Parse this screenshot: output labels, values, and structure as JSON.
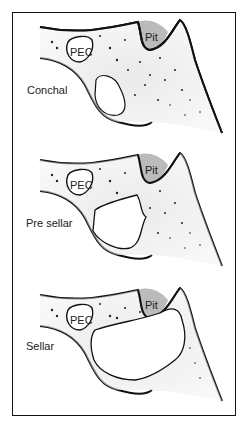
{
  "panels": [
    {
      "name": "conchal",
      "label": "Conchal",
      "pec": "PEC",
      "pit": "Pit"
    },
    {
      "name": "pre-sellar",
      "label": "Pre sellar",
      "pec": "PEC",
      "pit": "Pit"
    },
    {
      "name": "sellar",
      "label": "Sellar",
      "pec": "PEC",
      "pit": "Pit"
    }
  ]
}
